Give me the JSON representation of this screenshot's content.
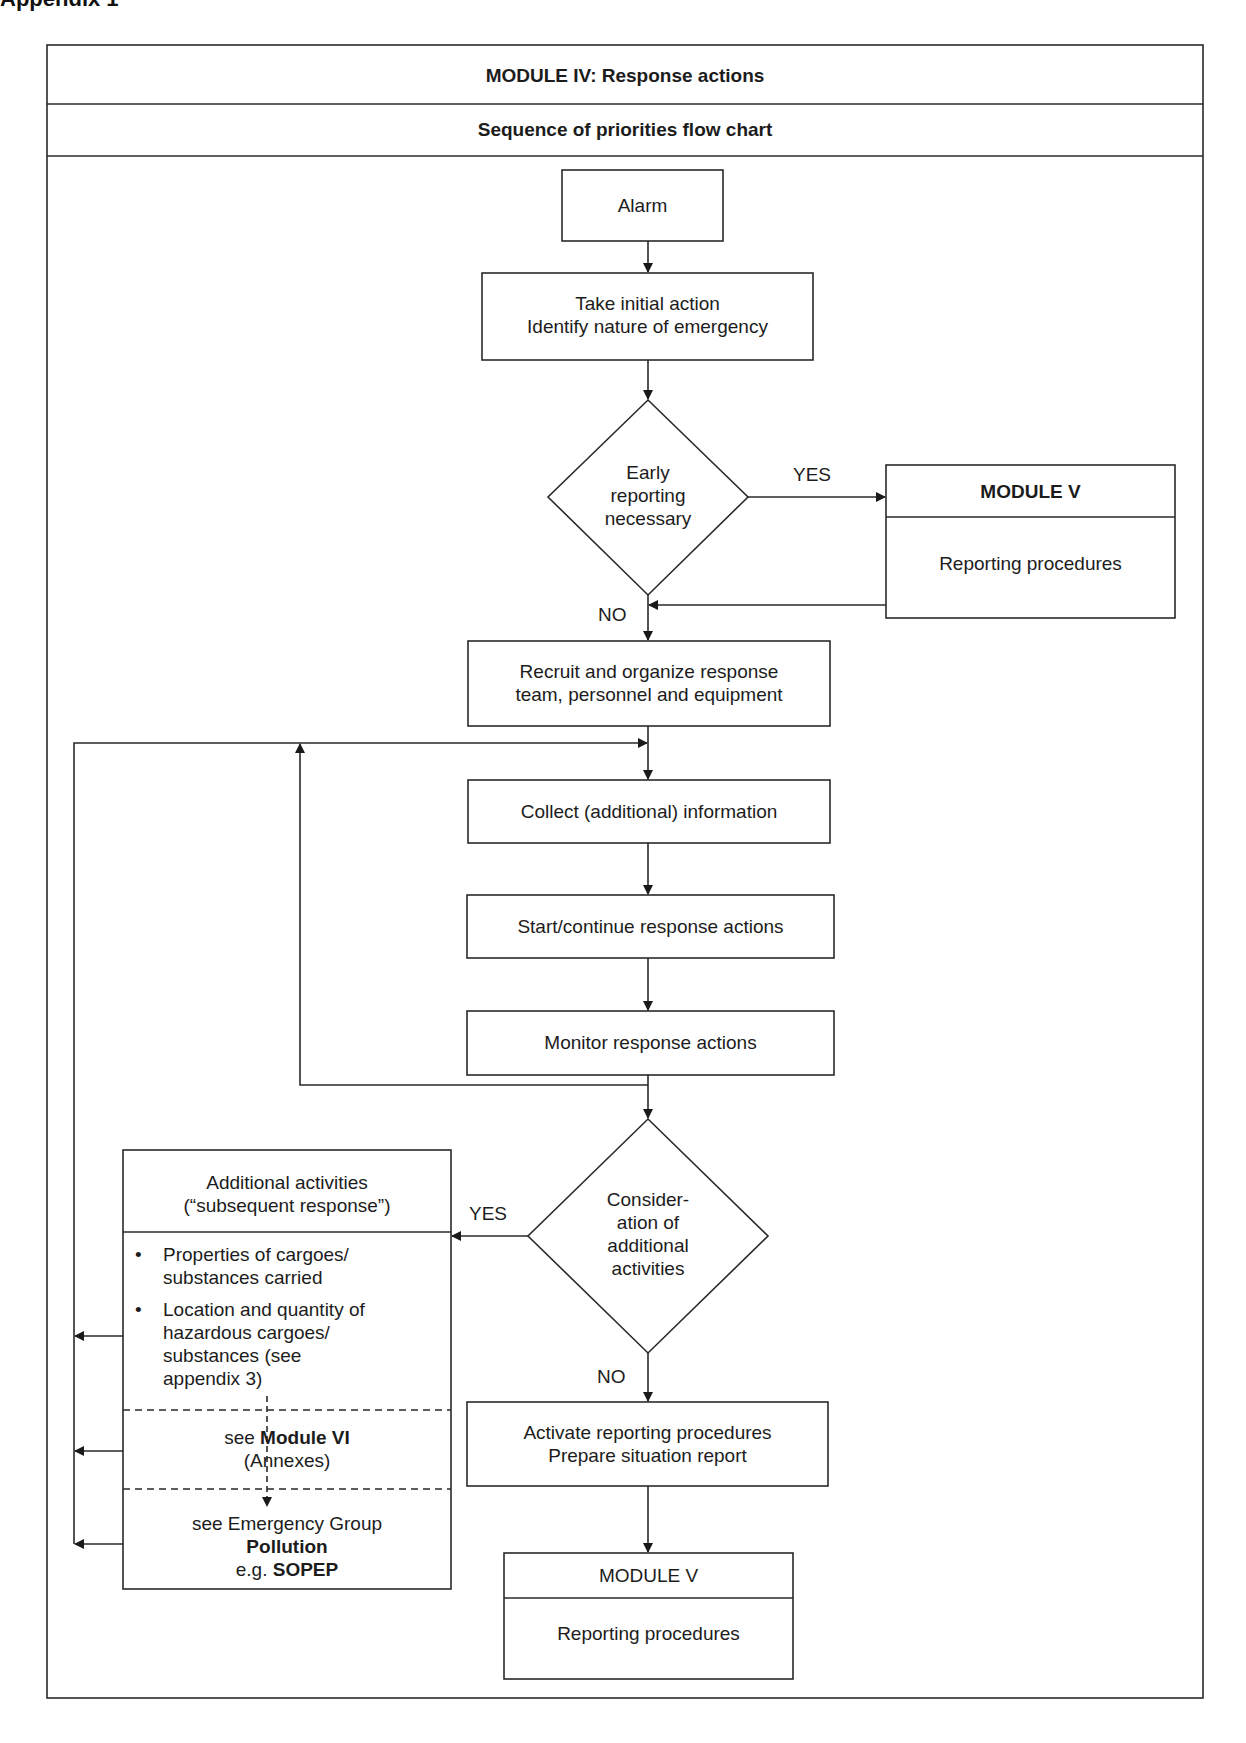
{
  "page": {
    "heading": "Appendix 1"
  },
  "header": {
    "title": "MODULE IV: Response actions",
    "subtitle": "Sequence of priorities flow chart"
  },
  "nodes": {
    "alarm": "Alarm",
    "initial_action": [
      "Take initial action",
      "Identify nature of emergency"
    ],
    "early_reporting": [
      "Early",
      "reporting",
      "necessary"
    ],
    "module_v_top": {
      "title": "MODULE V",
      "body": "Reporting procedures"
    },
    "recruit": [
      "Recruit and organize response",
      "team, personnel and equipment"
    ],
    "collect": "Collect (additional) information",
    "start_continue": "Start/continue response actions",
    "monitor": "Monitor response actions",
    "consideration": [
      "Consider-",
      "ation of",
      "additional",
      "activities"
    ],
    "additional": {
      "title": [
        "Additional activities",
        "(“subsequent response”)"
      ],
      "bullets": [
        "Properties of cargoes/ substances carried",
        "Location and quantity of hazardous cargoes/ substances (see appendix 3)"
      ],
      "module_vi": {
        "prefix": "see ",
        "bold": "Module VI",
        "line2": "(Annexes)"
      },
      "emergency": {
        "line1": "see Emergency Group",
        "bold": "Pollution",
        "prefix3": "e.g. ",
        "bold3": "SOPEP"
      }
    },
    "activate": [
      "Activate reporting procedures",
      "Prepare situation report"
    ],
    "module_v_bottom": {
      "title": "MODULE V",
      "body": "Reporting procedures"
    }
  },
  "labels": {
    "yes_1": "YES",
    "no_1": "NO",
    "yes_2": "YES",
    "no_2": "NO"
  },
  "colors": {
    "line": "#2a2a2a",
    "background": "#ffffff"
  }
}
